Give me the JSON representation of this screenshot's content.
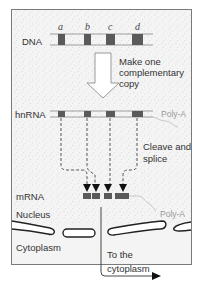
{
  "diagram": {
    "labels": {
      "dna": "DNA",
      "hnrna": "hnRNA",
      "mrna": "mRNA",
      "nucleus": "Nucleus",
      "cytoplasm": "Cytoplasm",
      "poly_a_top": "Poly-A",
      "poly_a_bottom": "Poly-A"
    },
    "genes": [
      "a",
      "b",
      "c",
      "d"
    ],
    "steps": {
      "copy": [
        "Make one",
        "complementary",
        "copy"
      ],
      "splice": [
        "Cleave and",
        "splice"
      ],
      "export": [
        "To the",
        "cytoplasm"
      ]
    },
    "colors": {
      "exon": "#5a5a5a",
      "line": "#888888",
      "nucleus_bg": "#f4f4f4",
      "stipple": "#b8b8b8"
    }
  }
}
